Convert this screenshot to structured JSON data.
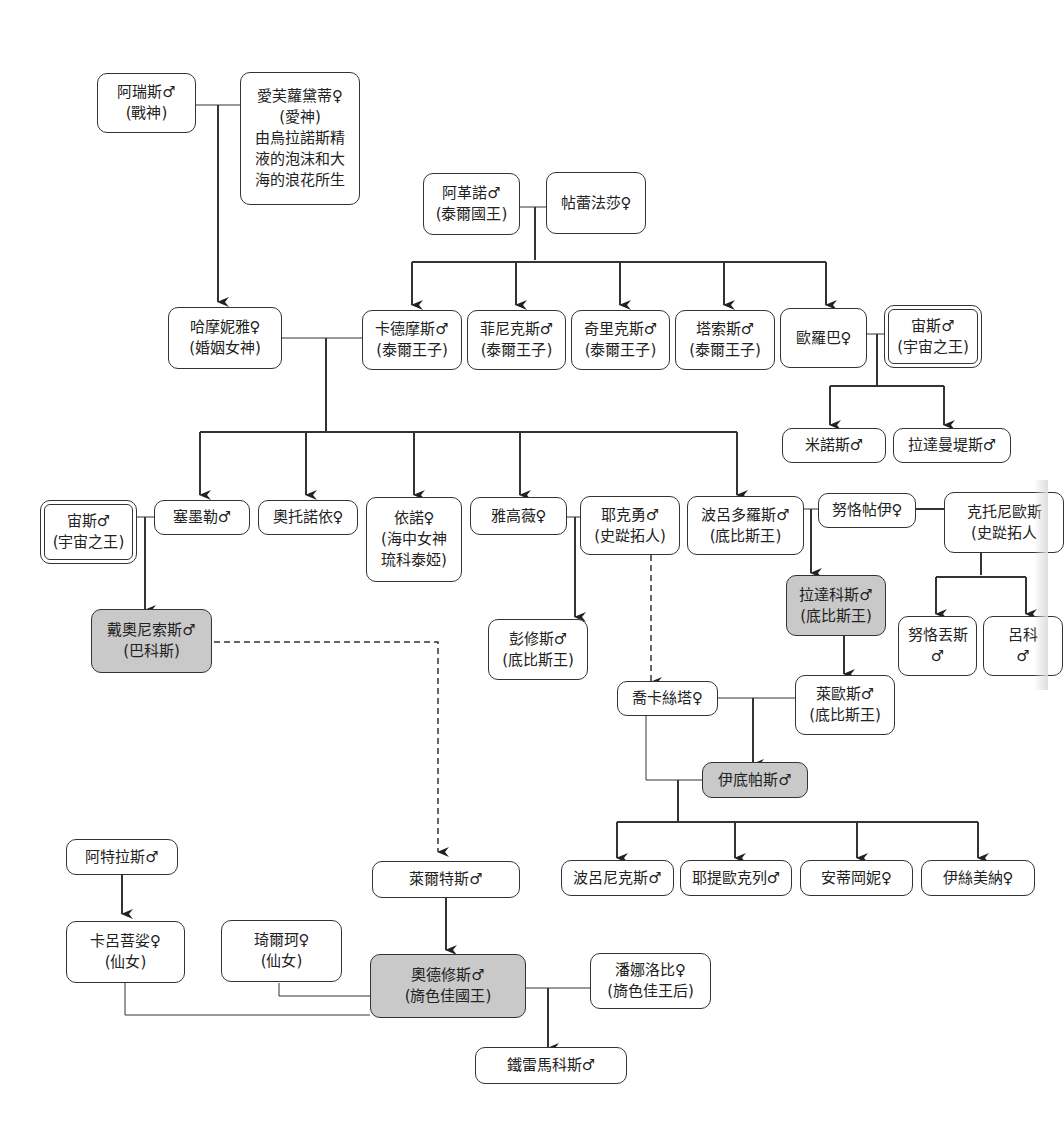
{
  "diagram": {
    "type": "family-tree",
    "title": "",
    "nodes": {
      "ares": {
        "lines": [
          "阿瑞斯♂",
          "(戰神)"
        ],
        "style": "normal"
      },
      "aphrodite": {
        "lines": [
          "愛芙蘿黛蒂♀",
          "(愛神)",
          "由烏拉諾斯精",
          "液的泡沫和大",
          "海的浪花所生"
        ],
        "style": "normal"
      },
      "agenor": {
        "lines": [
          "阿革諾♂",
          "(泰爾國王)"
        ],
        "style": "normal"
      },
      "telephassa": {
        "lines": [
          "帖蕾法莎♀"
        ],
        "style": "normal"
      },
      "harmonia": {
        "lines": [
          "哈摩妮雅♀",
          "(婚姻女神)"
        ],
        "style": "normal"
      },
      "cadmus": {
        "lines": [
          "卡德摩斯♂",
          "(泰爾王子)"
        ],
        "style": "normal"
      },
      "phoenix": {
        "lines": [
          "菲尼克斯♂",
          "(泰爾王子)"
        ],
        "style": "normal"
      },
      "cilix": {
        "lines": [
          "奇里克斯♂",
          "(泰爾王子)"
        ],
        "style": "normal"
      },
      "thasus": {
        "lines": [
          "塔索斯♂",
          "(泰爾王子)"
        ],
        "style": "normal"
      },
      "europa": {
        "lines": [
          "歐羅巴♀"
        ],
        "style": "normal"
      },
      "zeus1": {
        "lines": [
          "宙斯♂",
          "(宇宙之王)"
        ],
        "style": "double"
      },
      "minos": {
        "lines": [
          "米諾斯♂"
        ],
        "style": "normal"
      },
      "rhadamanthus": {
        "lines": [
          "拉達曼堤斯♂"
        ],
        "style": "normal"
      },
      "zeus2": {
        "lines": [
          "宙斯♂",
          "(宇宙之王)"
        ],
        "style": "double"
      },
      "semele": {
        "lines": [
          "塞墨勒♂"
        ],
        "style": "normal"
      },
      "autonoe": {
        "lines": [
          "奧托諾依♀"
        ],
        "style": "normal"
      },
      "ino": {
        "lines": [
          "依諾♀",
          "(海中女神",
          "琉科泰婭)"
        ],
        "style": "normal"
      },
      "agave": {
        "lines": [
          "雅高薇♀"
        ],
        "style": "normal"
      },
      "echion": {
        "lines": [
          "耶克勇♂",
          "(史踨拓人)"
        ],
        "style": "normal"
      },
      "polydorus": {
        "lines": [
          "波呂多羅斯♂",
          "(底比斯王)"
        ],
        "style": "normal"
      },
      "nycteis": {
        "lines": [
          "努恪帖伊♀"
        ],
        "style": "normal"
      },
      "chthonius": {
        "lines": [
          "克托尼歐斯",
          "(史踨拓人"
        ],
        "style": "normal"
      },
      "dionysus": {
        "lines": [
          "戴奧尼索斯♂",
          "(巴科斯)"
        ],
        "style": "shaded"
      },
      "pentheus": {
        "lines": [
          "彭修斯♂",
          "(底比斯王)"
        ],
        "style": "normal"
      },
      "labdacus": {
        "lines": [
          "拉達科斯♂",
          "(底比斯王)"
        ],
        "style": "shaded"
      },
      "nycteus": {
        "lines": [
          "努恪丟斯",
          "♂"
        ],
        "style": "normal"
      },
      "lycus": {
        "lines": [
          "呂科",
          "♂"
        ],
        "style": "normal"
      },
      "jocasta": {
        "lines": [
          "喬卡絲塔♀"
        ],
        "style": "normal"
      },
      "laius": {
        "lines": [
          "萊歐斯♂",
          "(底比斯王)"
        ],
        "style": "normal"
      },
      "oedipus": {
        "lines": [
          "伊底帕斯♂"
        ],
        "style": "shaded"
      },
      "polynices": {
        "lines": [
          "波呂尼克斯♂"
        ],
        "style": "normal"
      },
      "eteocles": {
        "lines": [
          "耶提歐克列♂"
        ],
        "style": "normal"
      },
      "antigone": {
        "lines": [
          "安蒂岡妮♀"
        ],
        "style": "normal"
      },
      "ismene": {
        "lines": [
          "伊絲美納♀"
        ],
        "style": "normal"
      },
      "atlas": {
        "lines": [
          "阿特拉斯♂"
        ],
        "style": "normal"
      },
      "laertes": {
        "lines": [
          "萊爾特斯♂"
        ],
        "style": "normal"
      },
      "calypso": {
        "lines": [
          "卡呂菩娑♀",
          "(仙女)"
        ],
        "style": "normal"
      },
      "circe": {
        "lines": [
          "琦爾珂♀",
          "(仙女)"
        ],
        "style": "normal"
      },
      "odysseus": {
        "lines": [
          "奧德修斯♂",
          "(旖色佳國王)"
        ],
        "style": "shaded"
      },
      "penelope": {
        "lines": [
          "潘娜洛比♀",
          "(旖色佳王后)"
        ],
        "style": "normal"
      },
      "telemachus": {
        "lines": [
          "鐵雷馬科斯♂"
        ],
        "style": "normal"
      }
    },
    "relations": [
      {
        "type": "marriage",
        "between": [
          "ares",
          "aphrodite"
        ],
        "children": [
          "harmonia"
        ]
      },
      {
        "type": "marriage",
        "between": [
          "agenor",
          "telephassa"
        ],
        "children": [
          "cadmus",
          "phoenix",
          "cilix",
          "thasus",
          "europa"
        ]
      },
      {
        "type": "marriage",
        "between": [
          "harmonia",
          "cadmus"
        ],
        "children": [
          "semele",
          "autonoe",
          "ino",
          "agave",
          "polydorus"
        ]
      },
      {
        "type": "marriage",
        "between": [
          "europa",
          "zeus1"
        ],
        "children": [
          "minos",
          "rhadamanthus"
        ]
      },
      {
        "type": "marriage",
        "between": [
          "zeus2",
          "semele"
        ],
        "children": [
          "dionysus"
        ]
      },
      {
        "type": "marriage",
        "between": [
          "agave",
          "echion"
        ],
        "children": [
          "pentheus"
        ]
      },
      {
        "type": "marriage",
        "between": [
          "polydorus",
          "nycteis"
        ],
        "children": [
          "labdacus"
        ]
      },
      {
        "type": "parent",
        "from": "chthonius",
        "to": [
          "nycteis",
          "nycteus",
          "lycus"
        ]
      },
      {
        "type": "parent",
        "from": "labdacus",
        "to": [
          "laius"
        ]
      },
      {
        "type": "marriage",
        "between": [
          "jocasta",
          "laius"
        ],
        "children": [
          "oedipus"
        ]
      },
      {
        "type": "marriage",
        "between": [
          "jocasta",
          "oedipus"
        ],
        "children": [
          "polynices",
          "eteocles",
          "antigone",
          "ismene"
        ]
      },
      {
        "type": "lineage-dashed",
        "from": "echion",
        "to": [
          "jocasta"
        ]
      },
      {
        "type": "lineage-dashed",
        "from": "dionysus",
        "to": [
          "laertes"
        ]
      },
      {
        "type": "parent",
        "from": "atlas",
        "to": [
          "calypso"
        ]
      },
      {
        "type": "parent",
        "from": "laertes",
        "to": [
          "odysseus"
        ]
      },
      {
        "type": "union",
        "between": [
          "calypso",
          "odysseus"
        ]
      },
      {
        "type": "union",
        "between": [
          "circe",
          "odysseus"
        ]
      },
      {
        "type": "marriage",
        "between": [
          "odysseus",
          "penelope"
        ],
        "children": [
          "telemachus"
        ]
      }
    ]
  }
}
